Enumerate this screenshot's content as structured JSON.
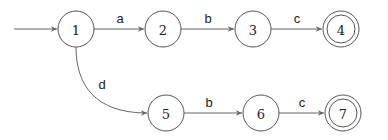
{
  "diagram": {
    "type": "finite-automaton",
    "start_state": "1",
    "states": [
      {
        "id": "1",
        "label": "1",
        "cx": 76,
        "cy": 29,
        "accepting": false
      },
      {
        "id": "2",
        "label": "2",
        "cx": 163,
        "cy": 29,
        "accepting": false
      },
      {
        "id": "3",
        "label": "3",
        "cx": 253,
        "cy": 29,
        "accepting": false
      },
      {
        "id": "4",
        "label": "4",
        "cx": 341,
        "cy": 29,
        "accepting": true
      },
      {
        "id": "5",
        "label": "5",
        "cx": 166,
        "cy": 113,
        "accepting": false
      },
      {
        "id": "6",
        "label": "6",
        "cx": 261,
        "cy": 113,
        "accepting": false
      },
      {
        "id": "7",
        "label": "7",
        "cx": 343,
        "cy": 113,
        "accepting": true
      }
    ],
    "transitions": [
      {
        "from": "1",
        "to": "2",
        "label": "a"
      },
      {
        "from": "2",
        "to": "3",
        "label": "b"
      },
      {
        "from": "3",
        "to": "4",
        "label": "c"
      },
      {
        "from": "1",
        "to": "5",
        "label": "d"
      },
      {
        "from": "5",
        "to": "6",
        "label": "b"
      },
      {
        "from": "6",
        "to": "7",
        "label": "c"
      }
    ],
    "colors": {
      "stroke": "#555555",
      "text": "#222222",
      "background": "#ffffff"
    }
  }
}
